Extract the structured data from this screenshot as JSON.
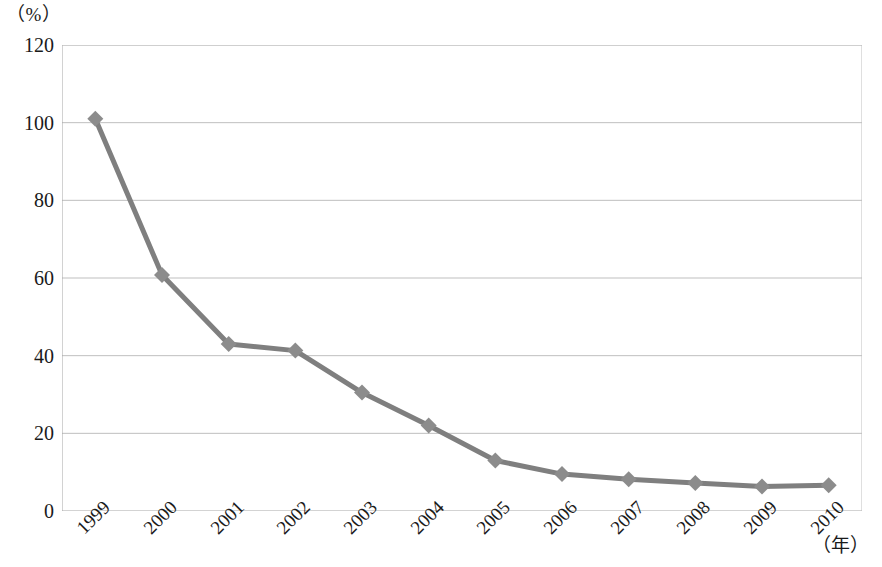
{
  "chart_data": {
    "type": "line",
    "title": "",
    "subtitle": "",
    "xlabel": "（年）",
    "ylabel": "（%）",
    "categories": [
      "1999",
      "2000",
      "2001",
      "2002",
      "2003",
      "2004",
      "2005",
      "2006",
      "2007",
      "2008",
      "2009",
      "2010"
    ],
    "values": [
      101,
      60.8,
      43,
      41.3,
      30.5,
      22,
      13,
      9.5,
      8.2,
      7.2,
      6.3,
      6.6
    ],
    "series": [
      {
        "name": "",
        "values": [
          101,
          60.8,
          43,
          41.3,
          30.5,
          22,
          13,
          9.5,
          8.2,
          7.2,
          6.3,
          6.6
        ]
      }
    ],
    "ylim": [
      0,
      120
    ],
    "y_ticks": [
      "0",
      "20",
      "40",
      "60",
      "80",
      "100",
      "120"
    ],
    "y_tick_values": [
      0,
      20,
      40,
      60,
      80,
      100,
      120
    ],
    "grid": "horizontal",
    "legend": "none",
    "marker": "diamond",
    "line_color": "#7f7f7f",
    "marker_color": "#8c8c8c",
    "grid_color": "#bfbfbf",
    "axis_color": "#a6a6a6",
    "text_color": "#1a1a1a"
  }
}
